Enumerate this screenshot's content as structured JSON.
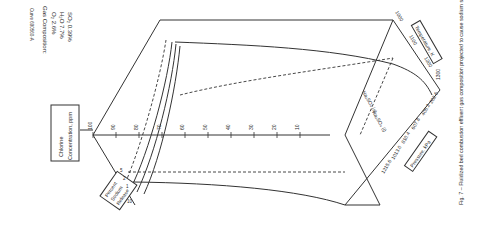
{
  "figure": {
    "doc_id": "Curve 690560-A",
    "caption": "Fig. 7 – Fluidized bed combustion effluent gas composition projected to cause sodium sulfate deposition",
    "gas_composition": {
      "title": "Gas Composition:",
      "o2": "O₂ 2.6%",
      "h2o": "H₂O 7.7%",
      "so2": "SO₂ 0.39%"
    },
    "chlorine_axis": {
      "label_line1": "Chlorine",
      "label_line2": "Concentration, ppm",
      "ticks": [
        "100",
        "90",
        "80",
        "70",
        "60",
        "50",
        "40",
        "30",
        "20",
        "10"
      ]
    },
    "temperature_axis": {
      "label": "Temperature, K",
      "ticks": [
        "1000",
        "1100",
        "1200",
        "1300"
      ]
    },
    "pressure_axis": {
      "label": "Pressure, kPa",
      "ticks": [
        "202.6",
        "405.2",
        "607.8",
        "810.4",
        "1013.0",
        "1215.6"
      ]
    },
    "sodium_release": {
      "label_line1": "Percent",
      "label_line2": "Sodium",
      "label_line3": "Release",
      "values": [
        "5",
        "2",
        "1",
        "10"
      ]
    },
    "phase_labels": {
      "solid": "Na₂SO₄ (s)",
      "liquid": "Na₂SO₄ (l)"
    }
  }
}
